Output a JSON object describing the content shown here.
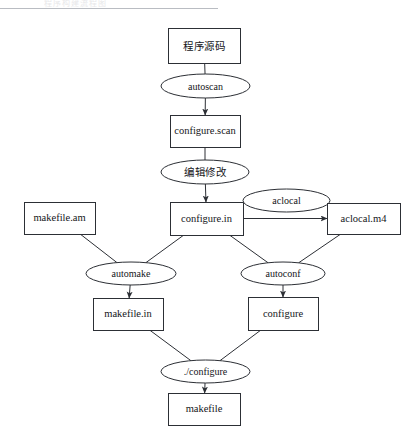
{
  "page": {
    "ghost_heading_text": "程序构建流程图",
    "width": 413,
    "height": 443,
    "background_color": "#ffffff",
    "stroke_color": "#2c2f35",
    "rule_color": "#b9bcc2"
  },
  "diagram": {
    "type": "flowchart",
    "nodes": [
      {
        "id": "src",
        "label": "程序源码",
        "shape": "rect",
        "x": 168,
        "y": 28,
        "w": 72,
        "h": 35,
        "cjk": true
      },
      {
        "id": "autoscan",
        "label": "autoscan",
        "shape": "ellipse",
        "x": 161,
        "y": 74,
        "w": 89,
        "h": 24,
        "cjk": false
      },
      {
        "id": "configure_scan",
        "label": "configure.scan",
        "shape": "rect",
        "x": 170,
        "y": 115,
        "w": 70,
        "h": 32,
        "cjk": false
      },
      {
        "id": "edit",
        "label": "编辑修改",
        "shape": "ellipse",
        "x": 161,
        "y": 160,
        "w": 88,
        "h": 24,
        "cjk": true
      },
      {
        "id": "makefile_am",
        "label": "makefile.am",
        "shape": "rect",
        "x": 24,
        "y": 202,
        "w": 71,
        "h": 32,
        "cjk": false
      },
      {
        "id": "configure_in",
        "label": "configure.in",
        "shape": "rect",
        "x": 170,
        "y": 202,
        "w": 73,
        "h": 33,
        "cjk": false
      },
      {
        "id": "aclocal",
        "label": "aclocal",
        "shape": "ellipse",
        "x": 243,
        "y": 189,
        "w": 87,
        "h": 23,
        "cjk": false
      },
      {
        "id": "aclocal_m4",
        "label": "aclocal.m4",
        "shape": "rect",
        "x": 327,
        "y": 203,
        "w": 73,
        "h": 31,
        "cjk": false
      },
      {
        "id": "automake",
        "label": "automake",
        "shape": "ellipse",
        "x": 86,
        "y": 262,
        "w": 90,
        "h": 23,
        "cjk": false
      },
      {
        "id": "autoconf",
        "label": "autoconf",
        "shape": "ellipse",
        "x": 241,
        "y": 262,
        "w": 84,
        "h": 23,
        "cjk": false
      },
      {
        "id": "makefile_in",
        "label": "makefile.in",
        "shape": "rect",
        "x": 93,
        "y": 298,
        "w": 70,
        "h": 32,
        "cjk": false
      },
      {
        "id": "configure",
        "label": "configure",
        "shape": "rect",
        "x": 248,
        "y": 297,
        "w": 70,
        "h": 33,
        "cjk": false
      },
      {
        "id": "run_configure",
        "label": "./configure",
        "shape": "ellipse",
        "x": 161,
        "y": 360,
        "w": 89,
        "h": 23,
        "cjk": false
      },
      {
        "id": "makefile",
        "label": "makefile",
        "shape": "rect",
        "x": 168,
        "y": 393,
        "w": 72,
        "h": 32,
        "cjk": false
      }
    ],
    "edges": [
      {
        "from": "src",
        "to": "autoscan",
        "arrow": false
      },
      {
        "from": "autoscan",
        "to": "configure_scan",
        "arrow": true
      },
      {
        "from": "configure_scan",
        "to": "edit",
        "arrow": false
      },
      {
        "from": "edit",
        "to": "configure_in",
        "arrow": true
      },
      {
        "from": "configure_in",
        "to": "aclocal_m4",
        "arrow": true
      },
      {
        "from": "makefile_am",
        "to": "automake",
        "arrow": false
      },
      {
        "from": "configure_in",
        "to": "automake",
        "arrow": false
      },
      {
        "from": "configure_in",
        "to": "autoconf",
        "arrow": false
      },
      {
        "from": "aclocal_m4",
        "to": "autoconf",
        "arrow": false
      },
      {
        "from": "automake",
        "to": "makefile_in",
        "arrow": true
      },
      {
        "from": "autoconf",
        "to": "configure",
        "arrow": true
      },
      {
        "from": "makefile_in",
        "to": "run_configure",
        "arrow": false
      },
      {
        "from": "configure",
        "to": "run_configure",
        "arrow": false
      },
      {
        "from": "run_configure",
        "to": "makefile",
        "arrow": true
      }
    ]
  }
}
